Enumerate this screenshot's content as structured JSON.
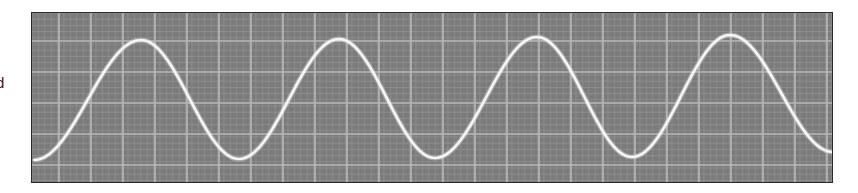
{
  "left_label_fragment": "d",
  "chart_data": {
    "type": "line",
    "title": "",
    "xlabel": "",
    "ylabel": "",
    "grid": true,
    "legend": null,
    "style": "oscilloscope trace, white line on gray graticule",
    "colors": {
      "background": "#7b7b7b",
      "major_grid": "#b9b9b9",
      "minor_grid": "#929292",
      "trace": "#f6f6f6",
      "border": "#2a2a2a"
    },
    "plot_px": {
      "left": 31,
      "top": 12,
      "right": 833,
      "bottom": 183
    },
    "major_grid_spacing_px": {
      "x": 32,
      "y": 31
    },
    "minor_divisions_per_major": 5,
    "series": [
      {
        "name": "sine wave",
        "waveform": "sinusoid",
        "cycles_visible": 4,
        "points_px": [
          {
            "x": 33,
            "y": 159,
            "kind": "start"
          },
          {
            "x": 140,
            "y": 39,
            "kind": "peak"
          },
          {
            "x": 238,
            "y": 158,
            "kind": "trough"
          },
          {
            "x": 338,
            "y": 38,
            "kind": "peak"
          },
          {
            "x": 434,
            "y": 157,
            "kind": "trough"
          },
          {
            "x": 536,
            "y": 36,
            "kind": "peak"
          },
          {
            "x": 631,
            "y": 156,
            "kind": "trough"
          },
          {
            "x": 729,
            "y": 34,
            "kind": "peak"
          },
          {
            "x": 832,
            "y": 151,
            "kind": "end"
          }
        ]
      }
    ]
  }
}
